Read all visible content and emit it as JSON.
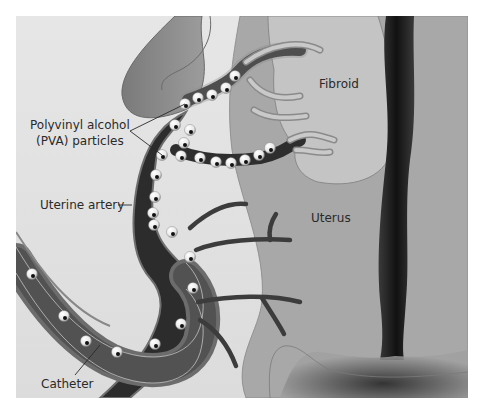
{
  "diagram": {
    "colors": {
      "background": "#e4e4e4",
      "uterus": "#a9a9a9",
      "fibroid": "#c3c3c3",
      "vessel_light": "#8c8c8c",
      "artery_dark": "#2c2c2c",
      "cavity": "#1c1c1c",
      "catheter": "#5e5e5e",
      "particle": "#f2f2f2"
    },
    "labels": {
      "pva_line1": "Polyvinyl alcohol",
      "pva_line2": "(PVA) particles",
      "uterine_artery": "Uterine artery",
      "catheter": "Catheter",
      "fibroid": "Fibroid",
      "uterus": "Uterus"
    }
  }
}
